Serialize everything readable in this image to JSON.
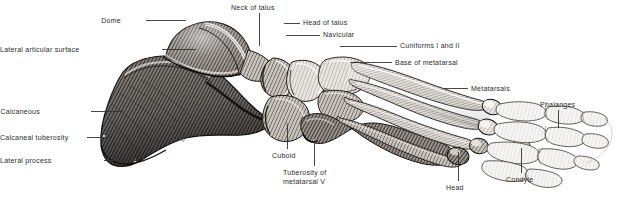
{
  "figure": {
    "background_color": "#ffffff",
    "ink_color": "#2b2b2b",
    "leader_color": "#333333",
    "style": "engraving / hatched line drawing",
    "width": 620,
    "height": 200
  },
  "labels": [
    {
      "id": "dome",
      "text": "Dome",
      "x": 121,
      "y": 17,
      "align": "right",
      "line": {
        "x1": 146,
        "y1": 20,
        "x2": 186,
        "y2": 20
      }
    },
    {
      "id": "lateral-articular-surface",
      "text": "Lateral articular surface",
      "x": 51,
      "y": 46,
      "align": "right",
      "line": {
        "x1": 162,
        "y1": 49,
        "x2": 196,
        "y2": 49
      }
    },
    {
      "id": "neck-of-talus",
      "text": "Neck of talus",
      "x": 231,
      "y": 4,
      "align": "left",
      "line": {
        "x1": 259,
        "y1": 13,
        "x2": 259,
        "y2": 46
      }
    },
    {
      "id": "head-of-talus",
      "text": "Head of talus",
      "x": 303,
      "y": 19,
      "align": "left",
      "line": {
        "x1": 284,
        "y1": 23,
        "x2": 300,
        "y2": 23
      }
    },
    {
      "id": "navicular",
      "text": "Navicular",
      "x": 323,
      "y": 31,
      "align": "left",
      "line": {
        "x1": 286,
        "y1": 35,
        "x2": 320,
        "y2": 35
      }
    },
    {
      "id": "cuniforms-i-and-ii",
      "text": "Cuniforms I and II",
      "x": 400,
      "y": 42,
      "align": "left",
      "line": {
        "x1": 340,
        "y1": 46,
        "x2": 397,
        "y2": 46
      }
    },
    {
      "id": "base-of-metatarsal",
      "text": "Base of metatarsal",
      "x": 395,
      "y": 59,
      "align": "left",
      "line": {
        "x1": 350,
        "y1": 62,
        "x2": 392,
        "y2": 62
      }
    },
    {
      "id": "metatarsals",
      "text": "Metatarsals",
      "x": 471,
      "y": 85,
      "align": "left",
      "line": {
        "x1": 443,
        "y1": 88,
        "x2": 468,
        "y2": 88
      }
    },
    {
      "id": "phalanges",
      "text": "Phalanges",
      "x": 540,
      "y": 101,
      "align": "left",
      "line": {
        "x1": 558,
        "y1": 110,
        "x2": 558,
        "y2": 128
      }
    },
    {
      "id": "calcaneous",
      "text": "Calcaneous",
      "x": 40,
      "y": 108,
      "align": "right",
      "line": {
        "x1": 91,
        "y1": 111,
        "x2": 123,
        "y2": 111
      }
    },
    {
      "id": "calcaneal-tuberosity",
      "text": "Calcaneal tuberosity",
      "x": 10,
      "y": 134,
      "align": "right",
      "line": {
        "x1": 87,
        "y1": 137,
        "x2": 112,
        "y2": 137
      }
    },
    {
      "id": "lateral-process",
      "text": "Lateral process",
      "x": 40,
      "y": 157,
      "align": "right",
      "line": {
        "x1": 104,
        "y1": 160,
        "x2": 139,
        "y2": 160
      }
    },
    {
      "id": "cuboid",
      "text": "Cuboid",
      "x": 272,
      "y": 152,
      "align": "left",
      "line": {
        "x1": 287,
        "y1": 124,
        "x2": 287,
        "y2": 149
      }
    },
    {
      "id": "tuberosity-of-metatarsal-v",
      "text": "Tuberosity of\nmetatarsal V",
      "x": 283,
      "y": 169,
      "align": "left",
      "line": {
        "x1": 314,
        "y1": 140,
        "x2": 314,
        "y2": 166
      }
    },
    {
      "id": "head",
      "text": "Head",
      "x": 446,
      "y": 184,
      "align": "center",
      "line": {
        "x1": 458,
        "y1": 152,
        "x2": 458,
        "y2": 181
      }
    },
    {
      "id": "condyle",
      "text": "Condyle",
      "x": 506,
      "y": 176,
      "align": "center",
      "line": {
        "x1": 521,
        "y1": 148,
        "x2": 521,
        "y2": 173
      }
    }
  ]
}
